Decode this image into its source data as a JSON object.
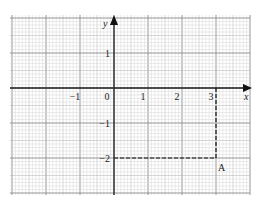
{
  "chart_data": {
    "type": "scatter",
    "title": "",
    "xlabel": "x",
    "ylabel": "y",
    "xlim": [
      -3.0,
      3.4
    ],
    "ylim": [
      -3.0,
      2.1
    ],
    "grid": true,
    "x_ticks": [
      -1,
      0,
      1,
      2,
      3
    ],
    "x_tick_labels": [
      "−1",
      "0",
      "1",
      "2",
      "3"
    ],
    "y_ticks": [
      1,
      -1,
      -2
    ],
    "y_tick_labels": [
      "1",
      "−1",
      "−2"
    ],
    "origin_label": "0",
    "points": [
      {
        "label": "A",
        "x": 3,
        "y": -2
      }
    ],
    "guides": [
      {
        "style": "dashed",
        "from": [
          3,
          0
        ],
        "to": [
          3,
          -2
        ]
      },
      {
        "style": "dashed",
        "from": [
          0,
          -2
        ],
        "to": [
          3,
          -2
        ]
      }
    ]
  },
  "labels": {
    "x_axis": "x",
    "y_axis": "y",
    "point_a": "A"
  }
}
